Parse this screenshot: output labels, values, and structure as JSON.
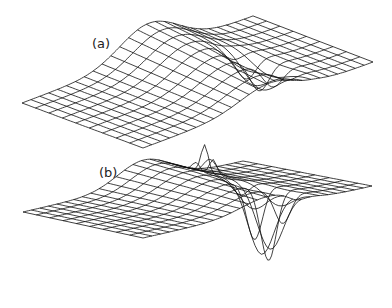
{
  "figure": {
    "panels": [
      {
        "id": "a",
        "label": "(a)",
        "description": "3D wireframe surface with a broad ridge and a moderate trough",
        "corners": {
          "front_left": [
            22,
            103
          ],
          "front_bottom": [
            143,
            148
          ],
          "right": [
            373,
            62
          ],
          "back": [
            253,
            16
          ]
        },
        "ridge": {
          "height": 32,
          "center_u": 0.55,
          "width": 0.18
        },
        "trough": {
          "depth": 30,
          "center_u": 0.68,
          "center_v": 0.35,
          "width_u": 0.06,
          "width_v": 0.2
        },
        "spike": {
          "height": 0
        }
      },
      {
        "id": "b",
        "label": "(b)",
        "description": "3D wireframe surface with a ridge, a sharp spike and a deep trough",
        "corners": {
          "front_left": [
            23,
            212
          ],
          "front_bottom": [
            143,
            238
          ],
          "right": [
            372,
            186
          ],
          "back": [
            243,
            161
          ]
        },
        "ridge": {
          "height": 24,
          "center_u": 0.55,
          "width": 0.17
        },
        "trough": {
          "depth": 75,
          "center_u": 0.67,
          "center_v": 0.25,
          "width_u": 0.05,
          "width_v": 0.15
        },
        "spike": {
          "height": 28,
          "center_u": 0.66,
          "center_v": 0.7,
          "width": 0.04
        }
      }
    ],
    "grid": {
      "u_lines": 26,
      "v_lines": 9
    },
    "line_color": "#111111",
    "background": "#ffffff"
  }
}
